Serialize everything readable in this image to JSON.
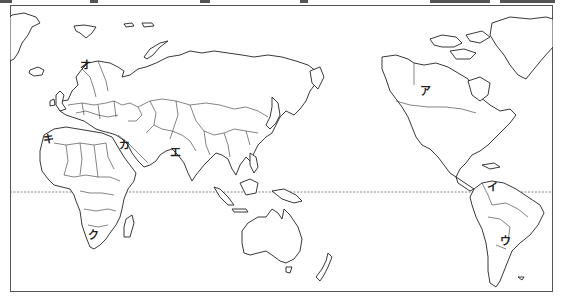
{
  "map": {
    "title": "World map (Pacific-centered)",
    "equator_label": "",
    "labels": [
      {
        "id": "a",
        "text": "ア",
        "region": "Canada",
        "x": 420,
        "y": 91
      },
      {
        "id": "i",
        "text": "イ",
        "region": "Colombia",
        "x": 488,
        "y": 186
      },
      {
        "id": "u",
        "text": "ウ",
        "region": "Argentina",
        "x": 501,
        "y": 241
      },
      {
        "id": "e",
        "text": "エ",
        "region": "India",
        "x": 171,
        "y": 152
      },
      {
        "id": "o",
        "text": "オ",
        "region": "Scandinavia",
        "x": 81,
        "y": 65
      },
      {
        "id": "ka",
        "text": "カ",
        "region": "Arabian Peninsula",
        "x": 119,
        "y": 145
      },
      {
        "id": "ki",
        "text": "キ",
        "region": "Morocco",
        "x": 43,
        "y": 134
      },
      {
        "id": "ku",
        "text": "ク",
        "region": "South Africa",
        "x": 89,
        "y": 234
      }
    ],
    "colors": {
      "line": "#222222",
      "background": "#ffffff",
      "equator": "#666666"
    }
  }
}
